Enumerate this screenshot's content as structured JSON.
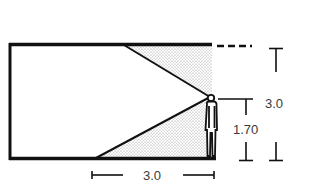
{
  "diagram": {
    "type": "section-sightline",
    "labels": {
      "room_height": "3.0",
      "eye_height": "1.70",
      "depth": "3.0"
    },
    "colors": {
      "line": "#111111",
      "stipple": "#9a9a9a",
      "text": "#3a3a3a",
      "background": "#ffffff"
    },
    "elements": [
      "room-outline",
      "upper-sightline",
      "lower-sightline",
      "stippled-visual-field",
      "human-figure",
      "dashed-ceiling-extension",
      "height-dimension",
      "eye-height-dimension",
      "depth-dimension"
    ]
  }
}
